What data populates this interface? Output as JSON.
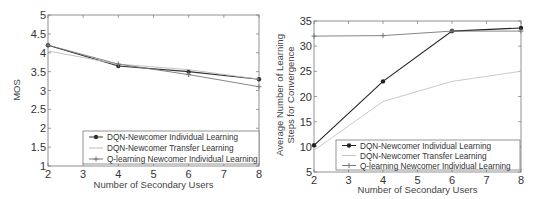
{
  "chart_data": [
    {
      "type": "line",
      "title": "",
      "xlabel": "Number of Secondary Users",
      "ylabel": "MOS",
      "x": [
        2,
        4,
        6,
        8
      ],
      "xticks": [
        2,
        3,
        4,
        5,
        6,
        7,
        8
      ],
      "yticks": [
        1,
        1.5,
        2,
        2.5,
        3,
        3.5,
        4,
        4.5,
        5
      ],
      "xlim": [
        2,
        8
      ],
      "ylim": [
        1,
        5
      ],
      "grid": false,
      "legend_position": "lower right",
      "series": [
        {
          "name": "DQN-Newcomer Individual Learning",
          "values": [
            4.2,
            3.65,
            3.5,
            3.3
          ],
          "color": "#333333",
          "marker": "dot"
        },
        {
          "name": "DQN-Newcomer Transfer Learning",
          "values": [
            4.05,
            3.7,
            3.55,
            3.3
          ],
          "color": "#bbbbbb",
          "marker": "none"
        },
        {
          "name": "Q-learning Newcomer Individual Learning",
          "values": [
            4.2,
            3.7,
            3.42,
            3.1
          ],
          "color": "#777777",
          "marker": "plus"
        }
      ]
    },
    {
      "type": "line",
      "title": "",
      "xlabel": "Number of Secondary Users",
      "ylabel": "Average Number of Learning Steps for Convergence",
      "ylabel_lines": [
        "Average Number of Learning",
        "Steps for Convergence"
      ],
      "x": [
        2,
        4,
        6,
        8
      ],
      "xticks": [
        2,
        3,
        4,
        5,
        6,
        7,
        8
      ],
      "yticks": [
        5,
        10,
        15,
        20,
        25,
        30,
        35
      ],
      "xlim": [
        2,
        8
      ],
      "ylim": [
        5,
        35
      ],
      "grid": false,
      "legend_position": "lower right",
      "series": [
        {
          "name": "DQN-Newcomer Individual Learning",
          "values": [
            10.3,
            23,
            33,
            33.6
          ],
          "color": "#222222",
          "marker": "dot"
        },
        {
          "name": "DQN-Newcomer Transfer Learning",
          "values": [
            9.3,
            19,
            23,
            25
          ],
          "color": "#c4c4c4",
          "marker": "none"
        },
        {
          "name": "Q-learning Newcomer Individual Learning",
          "values": [
            32,
            32.1,
            33,
            33
          ],
          "color": "#777777",
          "marker": "plus"
        }
      ]
    }
  ]
}
